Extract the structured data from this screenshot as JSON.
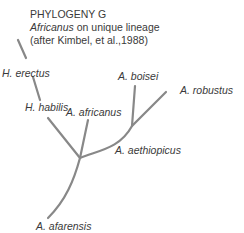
{
  "title": {
    "heading": "PHYLOGENY G",
    "subtitle_italic": "Africanus",
    "subtitle_rest": " on unique lineage",
    "citation": "(after Kimbel, et al.,1988)"
  },
  "taxa": [
    {
      "id": "h-erectus",
      "label": "H. erectus"
    },
    {
      "id": "h-habilis",
      "label": "H. habilis"
    },
    {
      "id": "a-africanus",
      "label": "A. africanus"
    },
    {
      "id": "a-boisei",
      "label": "A. boisei"
    },
    {
      "id": "a-robustus",
      "label": "A. robustus"
    },
    {
      "id": "a-aethiopicus",
      "label": "A. aethiopicus"
    },
    {
      "id": "a-afarensis",
      "label": "A. afarensis"
    }
  ],
  "colors": {
    "branch": "#888888",
    "text": "#3a3a3a",
    "background": "#ffffff"
  }
}
